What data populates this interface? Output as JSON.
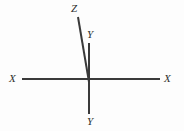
{
  "figure": {
    "background_color": "#fdfdfd",
    "line_color": "#3a3a3a",
    "label_color": "#2e2e2e",
    "width": 184,
    "height": 131
  },
  "labels": {
    "x_left": "X",
    "x_right": "X",
    "y_top": "Y",
    "y_bottom": "Y",
    "z": "Z"
  },
  "chart_data": {
    "type": "line",
    "title": "",
    "xlabel": "",
    "ylabel": "",
    "origin": [
      88,
      79
    ],
    "xlim": [
      0,
      184
    ],
    "ylim": [
      0,
      131
    ],
    "grid": false,
    "legend": "none",
    "series": [
      {
        "name": "X axis",
        "label_start": "X",
        "label_end": "X",
        "x": [
          22,
          160
        ],
        "y": [
          79,
          79
        ],
        "stroke_width": 2,
        "color": "#3a3a3a"
      },
      {
        "name": "Y axis",
        "label_start": "Y",
        "label_end": "Y",
        "x": [
          89,
          89
        ],
        "y": [
          43,
          114
        ],
        "stroke_width": 2,
        "color": "#3a3a3a"
      },
      {
        "name": "Z axis",
        "label_start": "Z",
        "label_end": "",
        "x": [
          78,
          89
        ],
        "y": [
          17,
          82
        ],
        "stroke_width": 2,
        "color": "#3a3a3a"
      }
    ]
  }
}
